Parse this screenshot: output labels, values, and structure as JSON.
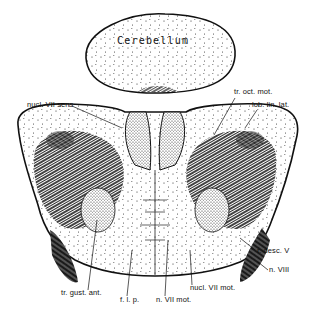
{
  "figure": {
    "type": "anatomical illustration",
    "colors": {
      "ink": "#111111",
      "paper": "#ffffff",
      "stipple": "#333333"
    }
  },
  "labels": {
    "cerebellum": "Cerebellum",
    "nucl_vii_sens": "nucl. VII sens",
    "tr_oct_mot": "tr. oct. mot.",
    "lob_lin_lat": "lob. lin. lat.",
    "r_desc_v": "r. desc. V",
    "n_viii": "n. VIII",
    "tr_gust_ant": "tr. gust. ant.",
    "f_l_p": "f. l. p.",
    "n_vii_mot": "n. VII mot.",
    "nucl_vii_mot": "nucl. VII mot."
  }
}
